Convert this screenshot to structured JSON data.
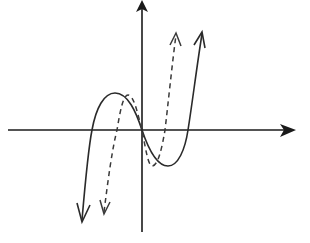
{
  "diagram": {
    "type": "function-graph",
    "axes": {
      "x_axis": {
        "arrow": "right",
        "labels": []
      },
      "y_axis": {
        "arrow": "up",
        "labels": []
      },
      "stroke_color": "#1a1a1a"
    },
    "curves": [
      {
        "name": "original-cubic",
        "style": "solid",
        "color": "#2a2a2a",
        "shape": "cubic with three x-intercepts, end arrows down-left and up-right",
        "key_points_px": {
          "start_arrow": [
            82,
            222
          ],
          "left_root": [
            92,
            130
          ],
          "local_max": [
            115,
            93
          ],
          "origin": [
            142,
            130
          ],
          "local_min": [
            168,
            166
          ],
          "right_root": [
            188,
            130
          ],
          "end_arrow": [
            202,
            32
          ]
        }
      },
      {
        "name": "transformed-cubic",
        "style": "dashed",
        "color": "#3a3a3a",
        "shape": "horizontally compressed cubic, same intercept at origin",
        "key_points_px": {
          "start_arrow": [
            103,
            214
          ],
          "left_root": [
            117,
            130
          ],
          "local_max": [
            128,
            95
          ],
          "origin": [
            142,
            130
          ],
          "local_min": [
            152,
            166
          ],
          "right_root": [
            165,
            130
          ],
          "end_arrow": [
            176,
            33
          ]
        }
      }
    ]
  }
}
